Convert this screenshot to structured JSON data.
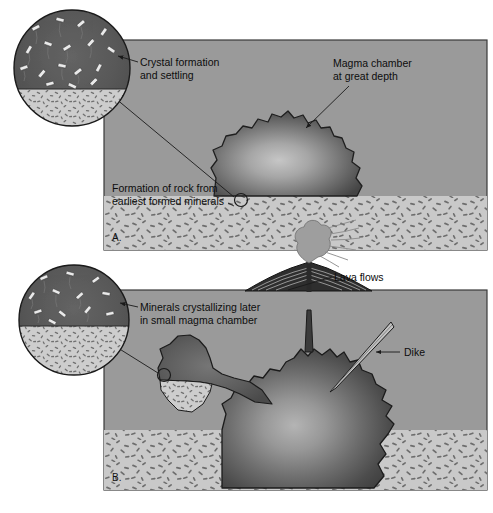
{
  "figure": {
    "background_color": "#ffffff"
  },
  "colors": {
    "ground": "#9a9a9a",
    "ground_edge": "#6f6f6f",
    "magma_dark": "#4a4a4a",
    "magma_light": "#b9b9b9",
    "plutonic_rock": "#c9c9c9",
    "speckle": "#6d6d6d",
    "crystal": "#e8e8e8",
    "outline": "#1a1a1a",
    "text": "#0d0d0d"
  },
  "panels": [
    {
      "id": "panel-a",
      "letter": "A.",
      "labels": [
        {
          "id": "crystal-formation",
          "text_line1": "Crystal formation",
          "text_line2": "and settling"
        },
        {
          "id": "rock-formation",
          "text_line1": "Formation of rock from",
          "text_line2": "earliest formed minerals"
        },
        {
          "id": "magma-chamber",
          "text_line1": "Magma chamber",
          "text_line2": "at great depth"
        }
      ],
      "inset": {
        "id": "inset-a",
        "description": "magnified view of magma with settling crystals",
        "crystal_count": 17
      }
    },
    {
      "id": "panel-b",
      "letter": "B.",
      "labels": [
        {
          "id": "minerals-later",
          "text_line1": "Minerals crystallizing later",
          "text_line2": "in small magma chamber"
        },
        {
          "id": "lava-flows",
          "text_line1": "Lava flows",
          "text_line2": ""
        },
        {
          "id": "dike",
          "text_line1": "Dike",
          "text_line2": ""
        }
      ],
      "inset": {
        "id": "inset-b",
        "description": "magnified view of small magma chamber with later crystals",
        "crystal_count": 12
      },
      "features": [
        {
          "id": "volcano",
          "name": "volcanic-cone"
        },
        {
          "id": "ash-plume",
          "name": "ash-plume"
        },
        {
          "id": "conduit",
          "name": "volcanic-conduit"
        },
        {
          "id": "dike-body",
          "name": "dike-intrusion"
        },
        {
          "id": "small-chamber",
          "name": "small-magma-chamber"
        },
        {
          "id": "large-chamber",
          "name": "large-magma-chamber"
        }
      ]
    }
  ]
}
